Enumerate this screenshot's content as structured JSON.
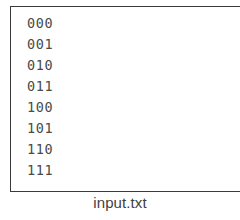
{
  "figure": {
    "caption": "input.txt",
    "background_color": "#ffffff"
  },
  "file_box": {
    "name": "input.txt",
    "border_color": "#3a3a3a",
    "fill_color": "#ffffff",
    "text_color": "#4a4a4a",
    "lines": [
      "000",
      "001",
      "010",
      "011",
      "100",
      "101",
      "110",
      "111"
    ],
    "line_count": 8
  }
}
